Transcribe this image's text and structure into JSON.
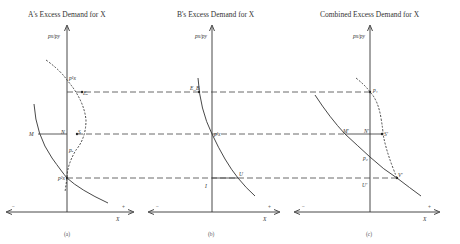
{
  "figure": {
    "panels": [
      {
        "id": "a",
        "title": "A's Excess Demand for X",
        "y_axis_label": "px/py",
        "x_axis_label": "X",
        "neg_sign": "−",
        "pos_sign": "+",
        "caption": "(a)",
        "points": {
          "p1": "p¹x",
          "E": "Eₐ",
          "M": "M",
          "N": "N",
          "S": "S",
          "pA": "pₐ",
          "p2": "p²x"
        }
      },
      {
        "id": "b",
        "title": "B's Excess Demand for X",
        "y_axis_label": "px/py",
        "x_axis_label": "X",
        "neg_sign": "−",
        "pos_sign": "+",
        "caption": "(b)",
        "points": {
          "E": "E_B",
          "pB": "p'x",
          "I": "I",
          "U": "U"
        }
      },
      {
        "id": "c",
        "title": "Combined Excess Demand for X",
        "y_axis_label": "px/py",
        "x_axis_label": "X",
        "neg_sign": "−",
        "pos_sign": "+",
        "caption": "(c)",
        "points": {
          "p1": "p₁",
          "M": "M'",
          "N": "N'",
          "S": "S'",
          "p2": "p₂",
          "U": "U'",
          "V": "V'"
        }
      }
    ]
  }
}
